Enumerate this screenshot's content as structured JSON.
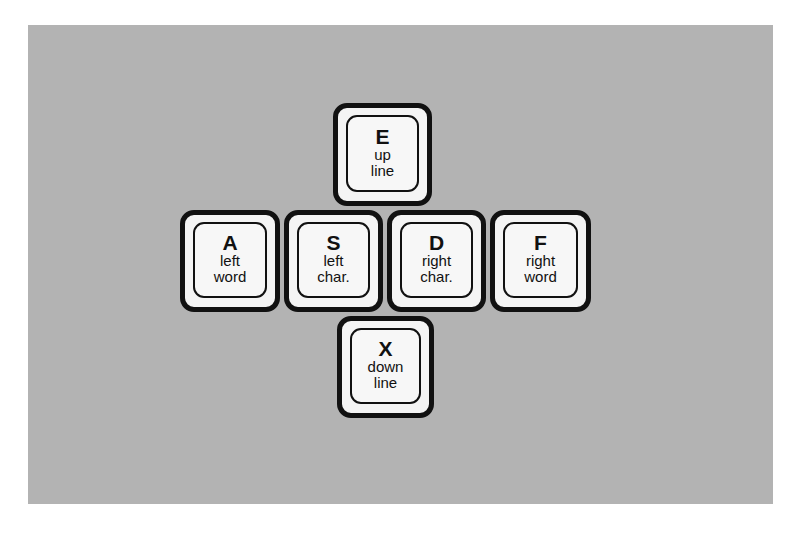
{
  "diagram": {
    "title": "",
    "background_color": "#b3b3b3",
    "key_border_color": "#111111",
    "key_fill_color": "#f4f4f4",
    "keys": [
      {
        "id": "e",
        "letter": "E",
        "line1": "up",
        "line2": "line",
        "position": "top"
      },
      {
        "id": "a",
        "letter": "A",
        "line1": "left",
        "line2": "word",
        "position": "middle-1"
      },
      {
        "id": "s",
        "letter": "S",
        "line1": "left",
        "line2": "char.",
        "position": "middle-2"
      },
      {
        "id": "d",
        "letter": "D",
        "line1": "right",
        "line2": "char.",
        "position": "middle-3"
      },
      {
        "id": "f",
        "letter": "F",
        "line1": "right",
        "line2": "word",
        "position": "middle-4"
      },
      {
        "id": "x",
        "letter": "X",
        "line1": "down",
        "line2": "line",
        "position": "bottom"
      }
    ]
  }
}
